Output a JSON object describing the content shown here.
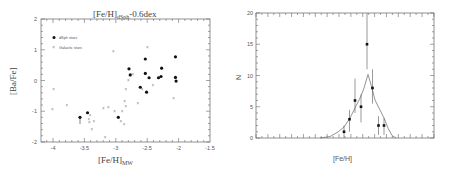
{
  "chart_data": [
    {
      "type": "scatter",
      "title": "[Fe/H]dSph-0.6dex",
      "title_main": "[Fe/H]",
      "title_sub": "dSph",
      "title_suffix": "-0.6dex",
      "xlabel": "[Fe/H]MW",
      "xlabel_main": "[Fe/H]",
      "xlabel_sub": "MW",
      "ylabel": "[Ba/Fe]",
      "xlim": [
        -4.25,
        -1.5
      ],
      "ylim": [
        -2,
        2
      ],
      "xticks": [
        -4,
        -3.5,
        -3,
        -2.5,
        -2,
        -1.5
      ],
      "xtick_labels": [
        "-4",
        "-3.5",
        "-3",
        "-2.5",
        "-2",
        "-1.5"
      ],
      "yticks": [
        -2,
        -1,
        0,
        1,
        2
      ],
      "ytick_labels": [
        "-2",
        "-1",
        "0",
        "1",
        "2"
      ],
      "legend_position": "upper left",
      "series": [
        {
          "name": "dSph stars",
          "marker": "filled-circle",
          "x": [
            -3.57,
            -3.45,
            -2.96,
            -2.79,
            -2.77,
            -2.53,
            -2.53,
            -2.47,
            -2.61,
            -2.51,
            -2.32,
            -2.27,
            -2.28,
            -2.05,
            -2.05,
            -2.04
          ],
          "y": [
            -1.2,
            -1.05,
            -1.2,
            0.38,
            0.18,
            0.7,
            0.23,
            0.09,
            -0.22,
            -0.38,
            0.09,
            0.4,
            0.13,
            0.77,
            0.1,
            -0.02
          ]
        },
        {
          "name": "Galactic stars",
          "marker": "cross",
          "x": [
            -3.99,
            -4.01,
            -3.78,
            -3.04,
            -2.5,
            -3.2,
            -3.12,
            -3.41,
            -3.42,
            -3.35,
            -3.38,
            -3.02,
            -2.9,
            -2.84,
            -2.86,
            -2.92,
            -2.87,
            -2.84,
            -2.8,
            -2.73,
            -2.65,
            -2.58,
            -2.41,
            -2.08,
            -3.17,
            -3.43
          ],
          "y": [
            -0.28,
            -0.96,
            -0.83,
            0.95,
            1.06,
            -0.9,
            -0.87,
            -1.15,
            -1.38,
            -1.34,
            -1.58,
            -1.02,
            -1.02,
            -0.85,
            -0.68,
            -1.35,
            -1.44,
            -0.28,
            -0.01,
            0.21,
            -0.74,
            -0.3,
            -0.15,
            -0.59,
            -1.87,
            -1.28
          ]
        }
      ]
    },
    {
      "type": "line",
      "title": "",
      "xlabel": "[Fe/H]",
      "ylabel": "N",
      "ylim": [
        0,
        20
      ],
      "yticks": [
        0,
        5,
        10,
        15,
        20
      ],
      "ytick_labels": [
        "0",
        "5",
        "10",
        "15",
        "20"
      ],
      "xtick_labels": [],
      "series": [
        {
          "name": "observed counts",
          "marker": "filled-square-errorbar",
          "x_bin": [
            1,
            2,
            3,
            4,
            5,
            6,
            7,
            8
          ],
          "y": [
            1,
            3,
            6,
            5,
            15,
            8,
            2,
            2
          ],
          "err_low": [
            1,
            2,
            2,
            2.5,
            4,
            2.5,
            1.5,
            1.5
          ],
          "err_high": [
            1,
            1.5,
            3.5,
            2,
            5,
            3,
            1.5,
            1.2
          ]
        },
        {
          "name": "model fit",
          "marker": "line",
          "peak_y": 10.2
        }
      ]
    }
  ]
}
